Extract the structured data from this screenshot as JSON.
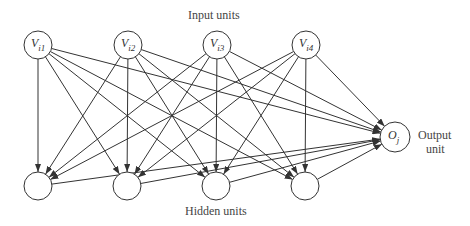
{
  "labels": {
    "input_title": "Input units",
    "hidden_title": "Hidden units",
    "output_title_line1": "Output",
    "output_title_line2": "unit"
  },
  "nodes": {
    "inputs": [
      {
        "id": "Vi1",
        "main": "V",
        "sub": "i1",
        "x": 38,
        "y": 45
      },
      {
        "id": "Vi2",
        "main": "V",
        "sub": "i2",
        "x": 128,
        "y": 45
      },
      {
        "id": "Vi3",
        "main": "V",
        "sub": "i3",
        "x": 217,
        "y": 45
      },
      {
        "id": "Vi4",
        "main": "V",
        "sub": "i4",
        "x": 306,
        "y": 45
      }
    ],
    "hidden": [
      {
        "id": "H1",
        "x": 38,
        "y": 186
      },
      {
        "id": "H2",
        "x": 127,
        "y": 186
      },
      {
        "id": "H3",
        "x": 216,
        "y": 186
      },
      {
        "id": "H4",
        "x": 305,
        "y": 186
      }
    ],
    "output": {
      "id": "Oj",
      "main": "O",
      "sub": "j",
      "x": 395,
      "y": 137
    }
  },
  "edges": "Each input unit connects to every hidden unit and to the output unit; each hidden unit connects to the output unit."
}
